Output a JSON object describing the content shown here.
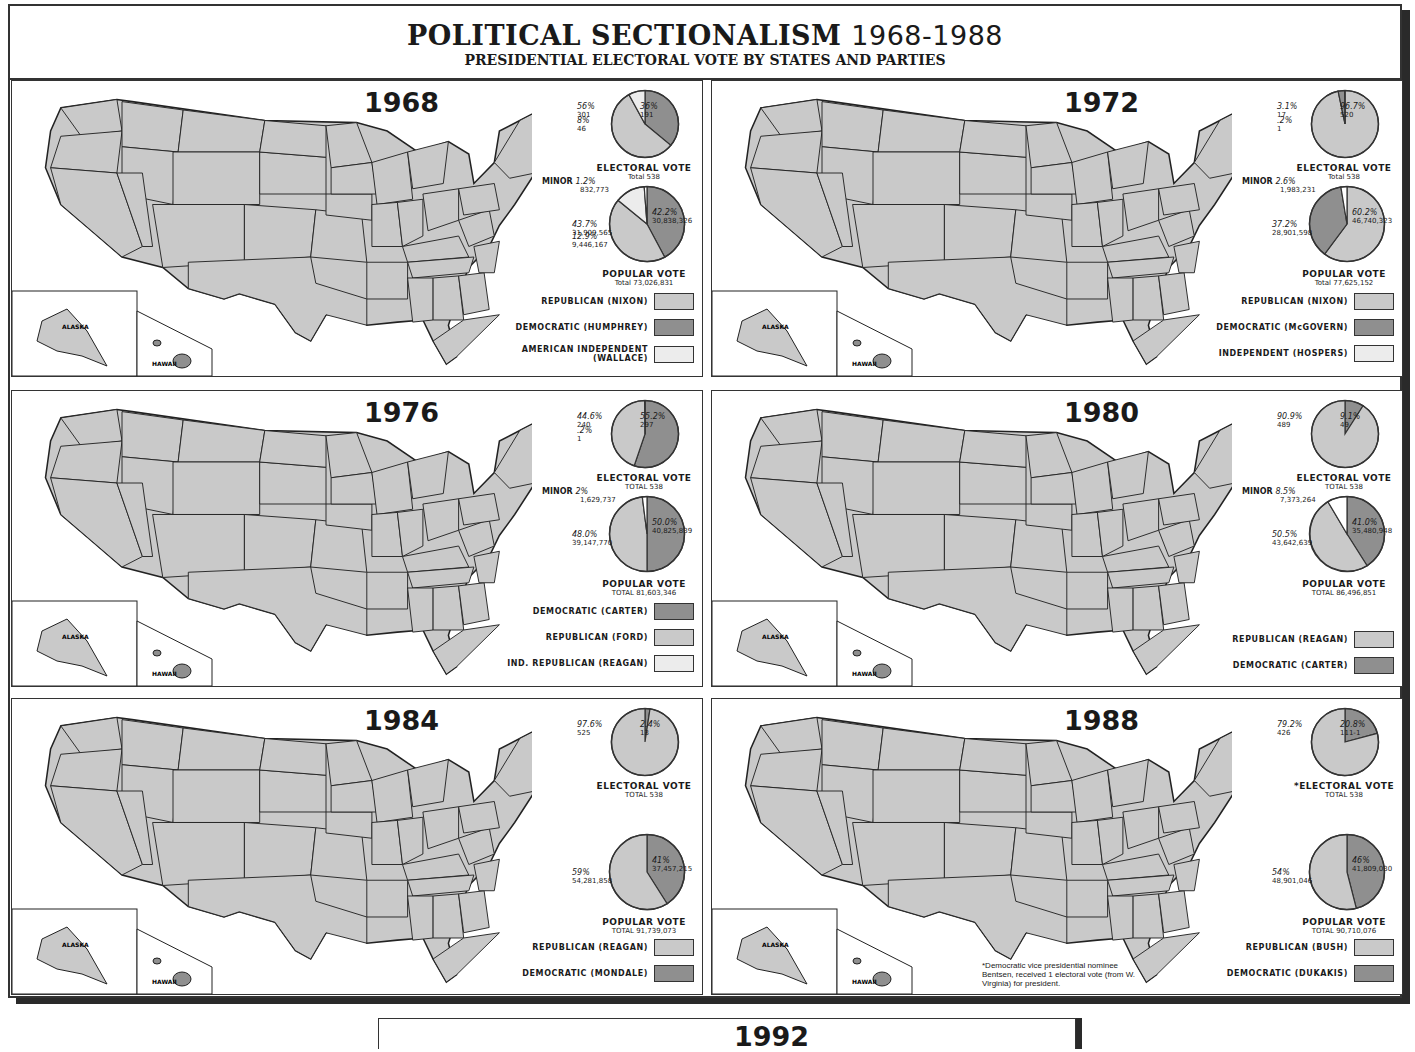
{
  "header": {
    "title": "POLITICAL SECTIONALISM",
    "title_years": "1968-1988",
    "subtitle": "PRESIDENTIAL ELECTORAL VOTE BY STATES AND PARTIES"
  },
  "colors": {
    "republican": "#c9c9c9",
    "democratic": "#8f8f8f",
    "third": "#ececec",
    "border": "#333333",
    "shadow": "#2a2a2a"
  },
  "panels": [
    {
      "year": "1968",
      "electoral": {
        "label": "ELECTORAL VOTE",
        "total": "Total 538",
        "slices": [
          {
            "pct": "36%",
            "votes": "191",
            "party": "democratic"
          },
          {
            "pct": "56%",
            "votes": "301",
            "party": "republican"
          },
          {
            "pct": "8%",
            "votes": "46",
            "party": "third"
          }
        ]
      },
      "popular": {
        "label": "POPULAR VOTE",
        "total": "Total 73,026,831",
        "minor_label": "MINOR",
        "minor_pct": "1.2%",
        "minor_votes": "832,773",
        "slices": [
          {
            "pct": "42.2%",
            "votes": "30,838,326",
            "party": "democratic"
          },
          {
            "pct": "43.7%",
            "votes": "31,909,565",
            "party": "republican"
          },
          {
            "pct": "12.9%",
            "votes": "9,446,167",
            "party": "third"
          }
        ]
      },
      "legend": [
        {
          "label": "REPUBLICAN (NIXON)",
          "party": "republican"
        },
        {
          "label": "DEMOCRATIC (HUMPHREY)",
          "party": "democratic"
        },
        {
          "label": "AMERICAN INDEPENDENT (WALLACE)",
          "party": "third"
        }
      ]
    },
    {
      "year": "1972",
      "electoral": {
        "label": "ELECTORAL VOTE",
        "total": "Total 538",
        "slices": [
          {
            "pct": "96.7%",
            "votes": "520",
            "party": "republican"
          },
          {
            "pct": "3.1%",
            "votes": "17",
            "party": "democratic"
          },
          {
            "pct": ".2%",
            "votes": "1",
            "party": "third"
          }
        ]
      },
      "popular": {
        "label": "POPULAR VOTE",
        "total": "Total 77,625,152",
        "minor_label": "MINOR",
        "minor_pct": "2.6%",
        "minor_votes": "1,983,231",
        "slices": [
          {
            "pct": "60.2%",
            "votes": "46,740,323",
            "party": "republican"
          },
          {
            "pct": "37.2%",
            "votes": "28,901,598",
            "party": "democratic"
          }
        ]
      },
      "legend": [
        {
          "label": "REPUBLICAN (NIXON)",
          "party": "republican"
        },
        {
          "label": "DEMOCRATIC (McGOVERN)",
          "party": "democratic"
        },
        {
          "label": "INDEPENDENT (HOSPERS)",
          "party": "third"
        }
      ]
    },
    {
      "year": "1976",
      "electoral": {
        "label": "ELECTORAL VOTE",
        "total": "TOTAL 538",
        "slices": [
          {
            "pct": "55.2%",
            "votes": "297",
            "party": "democratic"
          },
          {
            "pct": "44.6%",
            "votes": "240",
            "party": "republican"
          },
          {
            "pct": ".2%",
            "votes": "1",
            "party": "third"
          }
        ]
      },
      "popular": {
        "label": "POPULAR VOTE",
        "total": "TOTAL 81,603,346",
        "minor_label": "MINOR",
        "minor_pct": "2%",
        "minor_votes": "1,629,737",
        "slices": [
          {
            "pct": "50.0%",
            "votes": "40,825,839",
            "party": "democratic"
          },
          {
            "pct": "48.0%",
            "votes": "39,147,770",
            "party": "republican"
          }
        ]
      },
      "legend": [
        {
          "label": "DEMOCRATIC (CARTER)",
          "party": "democratic"
        },
        {
          "label": "REPUBLICAN (FORD)",
          "party": "republican"
        },
        {
          "label": "IND. REPUBLICAN (REAGAN)",
          "party": "third"
        }
      ]
    },
    {
      "year": "1980",
      "electoral": {
        "label": "ELECTORAL VOTE",
        "total": "TOTAL 538",
        "slices": [
          {
            "pct": "9.1%",
            "votes": "49",
            "party": "democratic"
          },
          {
            "pct": "90.9%",
            "votes": "489",
            "party": "republican"
          }
        ]
      },
      "popular": {
        "label": "POPULAR VOTE",
        "total": "TOTAL 86,496,851",
        "minor_label": "MINOR",
        "minor_pct": "8.5%",
        "minor_votes": "7,373,264",
        "slices": [
          {
            "pct": "41.0%",
            "votes": "35,480,948",
            "party": "democratic"
          },
          {
            "pct": "50.5%",
            "votes": "43,642,639",
            "party": "republican"
          }
        ]
      },
      "legend": [
        {
          "label": "REPUBLICAN (REAGAN)",
          "party": "republican"
        },
        {
          "label": "DEMOCRATIC (CARTER)",
          "party": "democratic"
        }
      ]
    },
    {
      "year": "1984",
      "electoral": {
        "label": "ELECTORAL VOTE",
        "total": "TOTAL 538",
        "slices": [
          {
            "pct": "2.4%",
            "votes": "13",
            "party": "democratic"
          },
          {
            "pct": "97.6%",
            "votes": "525",
            "party": "republican"
          }
        ]
      },
      "popular": {
        "label": "POPULAR VOTE",
        "total": "TOTAL 91,739,073",
        "slices": [
          {
            "pct": "41%",
            "votes": "37,457,215",
            "party": "democratic"
          },
          {
            "pct": "59%",
            "votes": "54,281,858",
            "party": "republican"
          }
        ]
      },
      "legend": [
        {
          "label": "REPUBLICAN (REAGAN)",
          "party": "republican"
        },
        {
          "label": "DEMOCRATIC (MONDALE)",
          "party": "democratic"
        }
      ]
    },
    {
      "year": "1988",
      "electoral": {
        "label": "*ELECTORAL VOTE",
        "total": "TOTAL 538",
        "slices": [
          {
            "pct": "20.8%",
            "votes": "111-1",
            "party": "democratic"
          },
          {
            "pct": "79.2%",
            "votes": "426",
            "party": "republican"
          }
        ]
      },
      "popular": {
        "label": "POPULAR VOTE",
        "total": "TOTAL 90,710,076",
        "slices": [
          {
            "pct": "46%",
            "votes": "41,809,030",
            "party": "democratic"
          },
          {
            "pct": "54%",
            "votes": "48,901,046",
            "party": "republican"
          }
        ]
      },
      "legend": [
        {
          "label": "REPUBLICAN (BUSH)",
          "party": "republican"
        },
        {
          "label": "DEMOCRATIC (DUKAKIS)",
          "party": "democratic"
        }
      ],
      "footnote": "*Democratic vice presidential nominee Bentsen, received 1 electoral vote (from W. Virginia) for president."
    }
  ],
  "bottom_partial": {
    "year": "1992"
  },
  "chart_data": [
    {
      "type": "pie",
      "title": "1968 Electoral Vote",
      "categories": [
        "Republican (Nixon)",
        "Democratic (Humphrey)",
        "American Independent (Wallace)"
      ],
      "values": [
        301,
        191,
        46
      ],
      "percent": [
        56,
        36,
        8
      ],
      "total": 538
    },
    {
      "type": "pie",
      "title": "1968 Popular Vote",
      "categories": [
        "Republican (Nixon)",
        "Democratic (Humphrey)",
        "American Independent (Wallace)",
        "Minor"
      ],
      "values": [
        31909565,
        30838326,
        9446167,
        832773
      ],
      "percent": [
        43.7,
        42.2,
        12.9,
        1.2
      ],
      "total": 73026831
    },
    {
      "type": "pie",
      "title": "1972 Electoral Vote",
      "categories": [
        "Republican (Nixon)",
        "Democratic (McGovern)",
        "Independent (Hospers)"
      ],
      "values": [
        520,
        17,
        1
      ],
      "percent": [
        96.7,
        3.1,
        0.2
      ],
      "total": 538
    },
    {
      "type": "pie",
      "title": "1972 Popular Vote",
      "categories": [
        "Republican (Nixon)",
        "Democratic (McGovern)",
        "Minor"
      ],
      "values": [
        46740323,
        28901598,
        1983231
      ],
      "percent": [
        60.2,
        37.2,
        2.6
      ],
      "total": 77625152
    },
    {
      "type": "pie",
      "title": "1976 Electoral Vote",
      "categories": [
        "Democratic (Carter)",
        "Republican (Ford)",
        "Ind. Republican (Reagan)"
      ],
      "values": [
        297,
        240,
        1
      ],
      "percent": [
        55.2,
        44.6,
        0.2
      ],
      "total": 538
    },
    {
      "type": "pie",
      "title": "1976 Popular Vote",
      "categories": [
        "Democratic (Carter)",
        "Republican (Ford)",
        "Minor"
      ],
      "values": [
        40825839,
        39147770,
        1629737
      ],
      "percent": [
        50.0,
        48.0,
        2
      ],
      "total": 81603346
    },
    {
      "type": "pie",
      "title": "1980 Electoral Vote",
      "categories": [
        "Republican (Reagan)",
        "Democratic (Carter)"
      ],
      "values": [
        489,
        49
      ],
      "percent": [
        90.9,
        9.1
      ],
      "total": 538
    },
    {
      "type": "pie",
      "title": "1980 Popular Vote",
      "categories": [
        "Republican (Reagan)",
        "Democratic (Carter)",
        "Minor"
      ],
      "values": [
        43642639,
        35480948,
        7373264
      ],
      "percent": [
        50.5,
        41.0,
        8.5
      ],
      "total": 86496851
    },
    {
      "type": "pie",
      "title": "1984 Electoral Vote",
      "categories": [
        "Republican (Reagan)",
        "Democratic (Mondale)"
      ],
      "values": [
        525,
        13
      ],
      "percent": [
        97.6,
        2.4
      ],
      "total": 538
    },
    {
      "type": "pie",
      "title": "1984 Popular Vote",
      "categories": [
        "Republican (Reagan)",
        "Democratic (Mondale)"
      ],
      "values": [
        54281858,
        37457215
      ],
      "percent": [
        59,
        41
      ],
      "total": 91739073
    },
    {
      "type": "pie",
      "title": "1988 Electoral Vote",
      "categories": [
        "Republican (Bush)",
        "Democratic (Dukakis)"
      ],
      "values": [
        426,
        111
      ],
      "percent": [
        79.2,
        20.8
      ],
      "total": 538,
      "annotation": "111-1: Bentsen received 1 electoral vote from W. Virginia"
    },
    {
      "type": "pie",
      "title": "1988 Popular Vote",
      "categories": [
        "Republican (Bush)",
        "Democratic (Dukakis)"
      ],
      "values": [
        48901046,
        41809030
      ],
      "percent": [
        54,
        46
      ],
      "total": 90710076
    }
  ]
}
